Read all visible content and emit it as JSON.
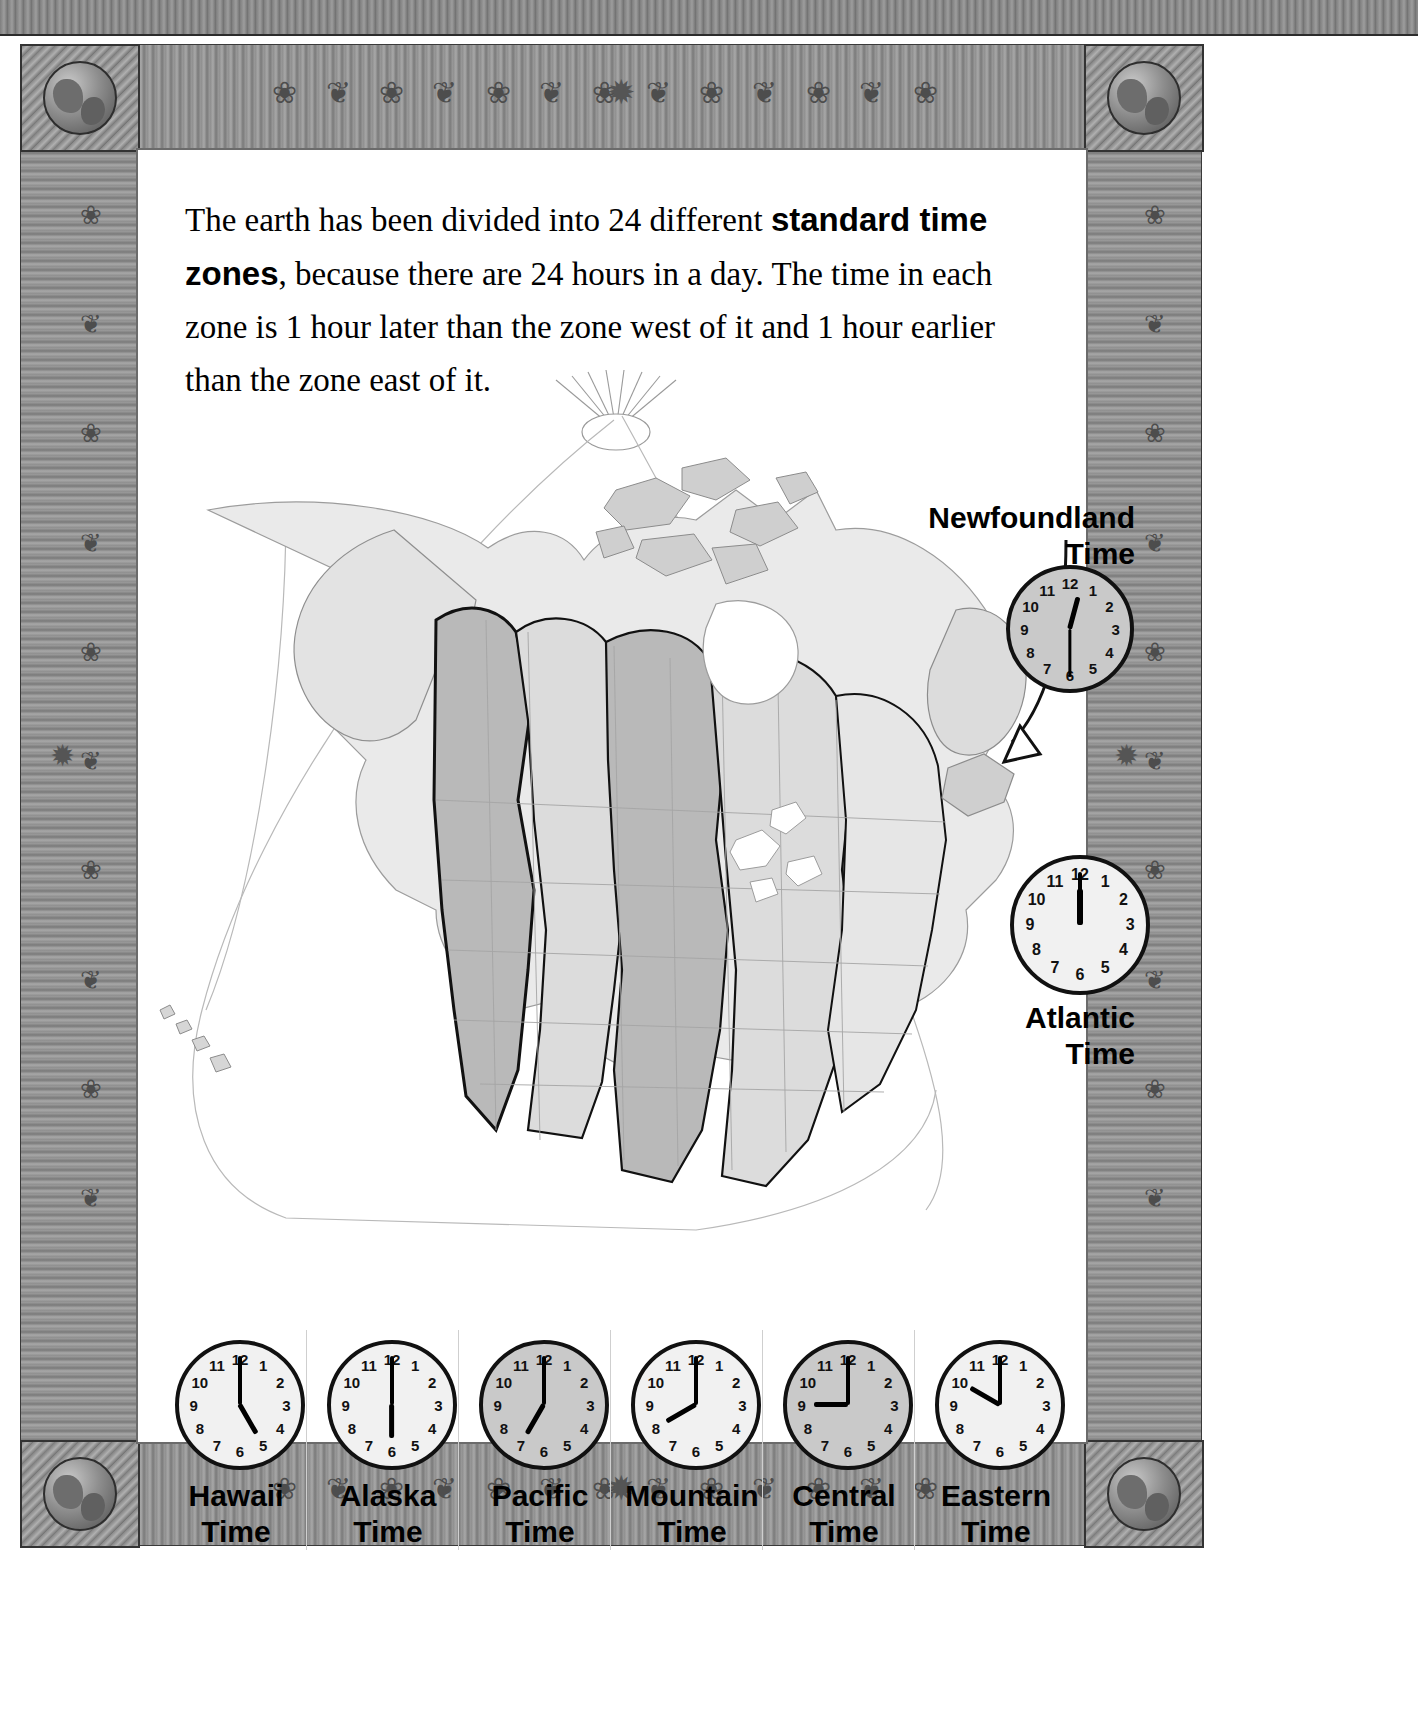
{
  "page": {
    "intro_text_parts": [
      "The earth has been divided into 24 different ",
      "standard time zones",
      ", because there are 24 hours in a day. The time in each zone is 1 hour later than the zone west of it and 1 hour earlier than the zone east of it."
    ],
    "intro_plain": "The earth has been divided into 24 different standard time zones, because there are 24 hours in a day. The time in each zone is 1 hour later than the zone west of it and 1 hour earlier than the zone east of it."
  },
  "ornaments": {
    "top": "❀ ❦ ❀ ❦ ❀ ❦ ❀ ❦ ❀ ❦ ❀ ❦ ❀",
    "bottom": "❀ ❦ ❀ ❦ ❀ ❦ ❀ ❦ ❀ ❦ ❀ ❦ ❀",
    "left": "❀ ❦ ❀ ❦ ❀ ❦ ❀ ❦ ❀ ❦",
    "right": "❀ ❦ ❀ ❦ ❀ ❦ ❀ ❦ ❀ ❦",
    "star": "✹"
  },
  "clock_numerals": [
    "12",
    "1",
    "2",
    "3",
    "4",
    "5",
    "6",
    "7",
    "8",
    "9",
    "10",
    "11"
  ],
  "side_zones": [
    {
      "name": "newfoundland",
      "label_line1": "Newfoundland",
      "label_line2": "Time",
      "hour": 12,
      "minute": 30,
      "face": "grey"
    },
    {
      "name": "atlantic",
      "label_line1": "Atlantic",
      "label_line2": "Time",
      "hour": 12,
      "minute": 0,
      "face": "light"
    }
  ],
  "bottom_zones": [
    {
      "name": "hawaii",
      "label_line1": "Hawaii",
      "label_line2": "Time",
      "hour": 5,
      "minute": 0,
      "face": "light"
    },
    {
      "name": "alaska",
      "label_line1": "Alaska",
      "label_line2": "Time",
      "hour": 6,
      "minute": 0,
      "face": "light"
    },
    {
      "name": "pacific",
      "label_line1": "Pacific",
      "label_line2": "Time",
      "hour": 7,
      "minute": 0,
      "face": "grey"
    },
    {
      "name": "mountain",
      "label_line1": "Mountain",
      "label_line2": "Time",
      "hour": 8,
      "minute": 0,
      "face": "light"
    },
    {
      "name": "central",
      "label_line1": "Central",
      "label_line2": "Time",
      "hour": 9,
      "minute": 0,
      "face": "grey"
    },
    {
      "name": "eastern",
      "label_line1": "Eastern",
      "label_line2": "Time",
      "hour": 10,
      "minute": 0,
      "face": "light"
    }
  ],
  "colors": {
    "ink": "#000000",
    "zone_dark": "#b9b9b9",
    "zone_light": "#dcdcdc",
    "zone_pale": "#efefef",
    "frame_grey": "#8d8d8d",
    "outline": "#6b6b6b"
  },
  "map": {
    "title": "North America standard time zones map",
    "sun_label": "sun rays at top of map"
  }
}
